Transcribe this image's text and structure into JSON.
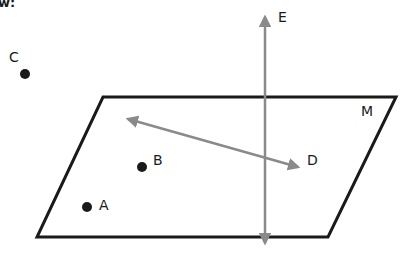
{
  "header": {
    "partial_text": "w:"
  },
  "colors": {
    "plane_stroke": "#1a1a1a",
    "line_stroke": "#8a8a8a",
    "point_fill": "#1a1a1a",
    "label_fill": "#1a1a1a",
    "background": "#ffffff"
  },
  "plane": {
    "label": "M",
    "corners": [
      [
        103,
        97
      ],
      [
        396,
        97
      ],
      [
        328,
        237
      ],
      [
        37,
        237
      ]
    ]
  },
  "lines": [
    {
      "label": "E",
      "type": "double-arrow",
      "from": [
        265,
        10
      ],
      "to": [
        265,
        250
      ]
    },
    {
      "label": "D",
      "type": "double-arrow",
      "from": [
        121,
        117
      ],
      "to": [
        305,
        169
      ]
    }
  ],
  "points": [
    {
      "label": "C",
      "x": 25,
      "y": 74
    },
    {
      "label": "B",
      "x": 142,
      "y": 167
    },
    {
      "label": "A",
      "x": 87,
      "y": 207
    }
  ],
  "labels": {
    "C": "C",
    "E": "E",
    "M": "M",
    "B": "B",
    "D": "D",
    "A": "A"
  }
}
